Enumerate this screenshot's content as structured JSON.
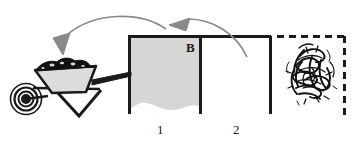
{
  "figure": {
    "background_color": "#ffffff",
    "ink_color": "#1a1a1a",
    "fill_color": "#d4d4d4",
    "arrow_color": "#808080"
  },
  "labels": {
    "bin_1": "1",
    "bin_2": "2",
    "bin_b": "B"
  },
  "icons": {
    "wheelbarrow": "wheelbarrow-icon",
    "mulch_pile": "mulch-pile-icon",
    "compost_pile": "compost-pile-icon",
    "arrow_to_wheelbarrow": "curved-arrow-left-icon",
    "arrow_to_bin_one": "curved-arrow-left-icon"
  },
  "structure": {
    "bins": [
      {
        "name": "bin-1",
        "label": "1",
        "filled": true,
        "fill_label": "B",
        "wall_style": "solid"
      },
      {
        "name": "bin-2",
        "label": "2",
        "filled": false,
        "wall_style": "solid"
      },
      {
        "name": "bin-3",
        "label": "",
        "filled": false,
        "wall_style": "dashed",
        "contains": "compost-pile-icon"
      }
    ]
  }
}
